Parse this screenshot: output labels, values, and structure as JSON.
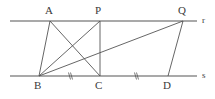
{
  "figure": {
    "background_color": "#ffffff",
    "stroke_color": "#555555",
    "label_color": "#3a3a3a",
    "width": 215,
    "height": 99
  },
  "points": [
    {
      "id": "A",
      "label": "A",
      "x": 50,
      "y": 21,
      "label_x": 45,
      "label_y": 6
    },
    {
      "id": "P",
      "label": "P",
      "x": 100,
      "y": 21,
      "label_x": 95,
      "label_y": 6
    },
    {
      "id": "Q",
      "label": "Q",
      "x": 183,
      "y": 21,
      "label_x": 178,
      "label_y": 6
    },
    {
      "id": "B",
      "label": "B",
      "x": 39,
      "y": 76,
      "label_x": 34,
      "label_y": 81
    },
    {
      "id": "C",
      "label": "C",
      "x": 100,
      "y": 76,
      "label_x": 95,
      "label_y": 81
    },
    {
      "id": "D",
      "label": "D",
      "x": 168,
      "y": 76,
      "label_x": 163,
      "label_y": 81
    }
  ],
  "lines": [
    {
      "id": "r",
      "label": "r",
      "type": "parallel-line-top",
      "x1": 10,
      "y1": 21,
      "x2": 197,
      "y2": 21,
      "label_x": 202,
      "label_y": 16
    },
    {
      "id": "s",
      "label": "s",
      "type": "parallel-line-bottom",
      "x1": 10,
      "y1": 76,
      "x2": 197,
      "y2": 76,
      "label_x": 202,
      "label_y": 72
    }
  ],
  "segments": [
    {
      "id": "AB",
      "from": "A",
      "to": "B",
      "x1": 50,
      "y1": 21,
      "x2": 39,
      "y2": 76
    },
    {
      "id": "AC",
      "from": "A",
      "to": "C",
      "x1": 50,
      "y1": 21,
      "x2": 100,
      "y2": 76
    },
    {
      "id": "PB",
      "from": "P",
      "to": "B",
      "x1": 100,
      "y1": 21,
      "x2": 39,
      "y2": 76
    },
    {
      "id": "PC",
      "from": "P",
      "to": "C",
      "x1": 100,
      "y1": 21,
      "x2": 100,
      "y2": 76
    },
    {
      "id": "BQ",
      "from": "B",
      "to": "Q",
      "x1": 39,
      "y1": 76,
      "x2": 183,
      "y2": 21
    },
    {
      "id": "QD",
      "from": "Q",
      "to": "D",
      "x1": 183,
      "y1": 21,
      "x2": 168,
      "y2": 76
    }
  ],
  "tick_marks": [
    {
      "id": "tick-BC",
      "on_segment": "BC",
      "glyph": "//",
      "x": 70,
      "y": 76
    },
    {
      "id": "tick-CD",
      "on_segment": "CD",
      "glyph": "//",
      "x": 136,
      "y": 76
    }
  ]
}
